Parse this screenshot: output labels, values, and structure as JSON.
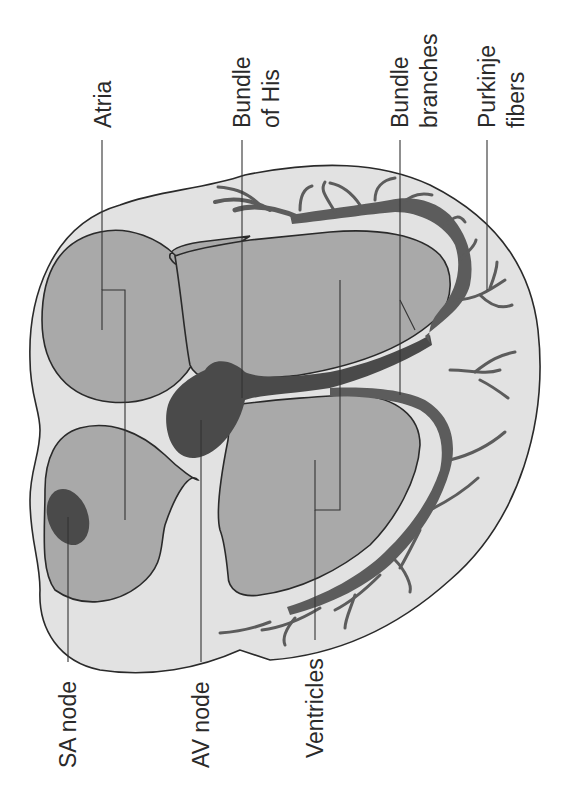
{
  "diagram": {
    "orientation": "rotated-90-ccw",
    "labels": [
      {
        "id": "sa-node",
        "lines": [
          "SA node"
        ]
      },
      {
        "id": "av-node",
        "lines": [
          "AV node"
        ]
      },
      {
        "id": "ventricles",
        "lines": [
          "Ventricles"
        ]
      },
      {
        "id": "atria",
        "lines": [
          "Atria"
        ]
      },
      {
        "id": "bundle-of-his",
        "lines": [
          "Bundle",
          "of His"
        ]
      },
      {
        "id": "bundle-branches",
        "lines": [
          "Bundle",
          "branches"
        ]
      },
      {
        "id": "purkinje-fibers",
        "lines": [
          "Purkinje",
          "fibers"
        ]
      }
    ],
    "colors": {
      "background": "#ffffff",
      "heart_wall": "#e2e2e2",
      "chambers": "#a9a9a9",
      "nodes": "#4a4a4a",
      "conduction_pathway": "#5c5c5c",
      "outline": "#2a2a2a"
    }
  }
}
